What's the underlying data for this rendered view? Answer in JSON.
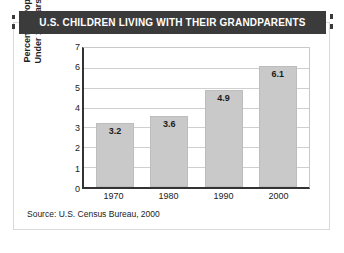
{
  "banner": {
    "title": "U.S. CHILDREN LIVING WITH THEIR GRANDPARENTS",
    "background_color": "#3b3b3b",
    "text_color": "#ffffff"
  },
  "source_note": "Source: U.S. Census Bureau, 2000",
  "axis_title_line1": "Percent of Population",
  "axis_title_line2": "Under 18 Years of Age",
  "chart_data": {
    "type": "bar",
    "title": "U.S. CHILDREN LIVING WITH THEIR GRANDPARENTS",
    "categories": [
      "1970",
      "1980",
      "1990",
      "2000"
    ],
    "values": [
      3.2,
      3.6,
      4.9,
      6.1
    ],
    "value_labels": [
      "3.2",
      "3.6",
      "4.9",
      "6.1"
    ],
    "xlabel": "",
    "ylabel": "Percent of Population Under 18 Years of Age",
    "ylim": [
      0,
      7
    ],
    "yticks": [
      0,
      1,
      2,
      3,
      4,
      5,
      6,
      7
    ],
    "ytick_labels": [
      "0",
      "1",
      "2",
      "3",
      "4",
      "5",
      "6",
      "7"
    ],
    "grid": true,
    "grid_axis": "y",
    "legend": false,
    "bar_color": "#c9c9c9",
    "bar_edge_color": "#bdbdbd",
    "gridline_color": "#cfcfcf",
    "axis_color": "#333333",
    "source": "Source: U.S. Census Bureau, 2000"
  }
}
